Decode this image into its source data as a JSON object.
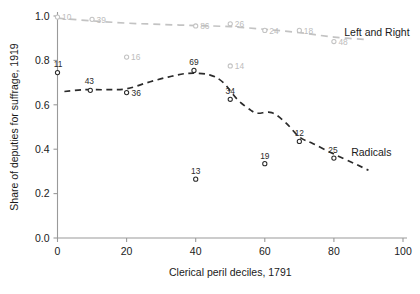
{
  "chart_data": {
    "type": "scatter",
    "title": "",
    "xlabel": "Clerical peril deciles, 1791",
    "ylabel": "Share of deputies for suffrage, 1919",
    "xlim": [
      -4,
      104
    ],
    "ylim": [
      0.0,
      1.02
    ],
    "xticks": [
      0,
      20,
      40,
      60,
      80,
      100
    ],
    "xticklabels": [
      "0",
      "20",
      "40",
      "60",
      "80",
      "100"
    ],
    "yticks": [
      0.0,
      0.2,
      0.4,
      0.6,
      0.8,
      1.0
    ],
    "yticklabels": [
      "0.0",
      "0.2",
      "0.4",
      "0.6",
      "0.8",
      "1.0"
    ],
    "grid": false,
    "legend_position": "inline-right",
    "colors": {
      "radicals": "#2b2b2b",
      "left_and_right": "#c3c3c3",
      "axis": "#9a9a9a",
      "text": "#1a1a1a"
    },
    "series": [
      {
        "name": "Left and Right",
        "label_text": "Left and Right",
        "color": "#c3c3c3",
        "marker": "open-circle",
        "linestyle": "dashed",
        "label_x": 83,
        "label_y": 0.925,
        "points": [
          {
            "x": 0,
            "y": 0.995,
            "label": "10"
          },
          {
            "x": 10,
            "y": 0.985,
            "label": "39"
          },
          {
            "x": 20,
            "y": 0.815,
            "label": "16"
          },
          {
            "x": 40,
            "y": 0.955,
            "label": "86"
          },
          {
            "x": 50,
            "y": 0.965,
            "label": "26"
          },
          {
            "x": 50,
            "y": 0.775,
            "label": "14"
          },
          {
            "x": 60,
            "y": 0.935,
            "label": "24"
          },
          {
            "x": 70,
            "y": 0.935,
            "label": "18"
          },
          {
            "x": 80,
            "y": 0.885,
            "label": "48"
          }
        ],
        "trend": [
          {
            "x": 0,
            "y": 0.99
          },
          {
            "x": 10,
            "y": 0.978
          },
          {
            "x": 20,
            "y": 0.968
          },
          {
            "x": 30,
            "y": 0.962
          },
          {
            "x": 40,
            "y": 0.957
          },
          {
            "x": 50,
            "y": 0.952
          },
          {
            "x": 60,
            "y": 0.94
          },
          {
            "x": 70,
            "y": 0.925
          },
          {
            "x": 80,
            "y": 0.905
          },
          {
            "x": 90,
            "y": 0.893
          }
        ]
      },
      {
        "name": "Radicals",
        "label_text": "Radicals",
        "color": "#2b2b2b",
        "marker": "open-circle",
        "linestyle": "dashed",
        "label_x": 85,
        "label_y": 0.385,
        "points": [
          {
            "x": 0,
            "y": 0.745,
            "label": "11"
          },
          {
            "x": 9.5,
            "y": 0.665,
            "label": "43"
          },
          {
            "x": 20,
            "y": 0.655,
            "label": "36"
          },
          {
            "x": 39.5,
            "y": 0.755,
            "label": "69"
          },
          {
            "x": 40,
            "y": 0.265,
            "label": "13"
          },
          {
            "x": 50,
            "y": 0.625,
            "label": "34"
          },
          {
            "x": 60,
            "y": 0.335,
            "label": "19"
          },
          {
            "x": 70,
            "y": 0.435,
            "label": "12"
          },
          {
            "x": 80,
            "y": 0.36,
            "label": "25"
          }
        ],
        "trend": [
          {
            "x": 2,
            "y": 0.66
          },
          {
            "x": 8,
            "y": 0.668
          },
          {
            "x": 14,
            "y": 0.668
          },
          {
            "x": 20,
            "y": 0.672
          },
          {
            "x": 26,
            "y": 0.7
          },
          {
            "x": 32,
            "y": 0.725
          },
          {
            "x": 38,
            "y": 0.742
          },
          {
            "x": 44,
            "y": 0.735
          },
          {
            "x": 48,
            "y": 0.7
          },
          {
            "x": 52,
            "y": 0.625
          },
          {
            "x": 56,
            "y": 0.575
          },
          {
            "x": 58,
            "y": 0.562
          },
          {
            "x": 62,
            "y": 0.565
          },
          {
            "x": 66,
            "y": 0.52
          },
          {
            "x": 70,
            "y": 0.455
          },
          {
            "x": 74,
            "y": 0.425
          },
          {
            "x": 80,
            "y": 0.378
          },
          {
            "x": 86,
            "y": 0.335
          },
          {
            "x": 90,
            "y": 0.305
          }
        ]
      }
    ]
  },
  "axes": {
    "x_title": "Clerical peril deciles, 1791",
    "y_title": "Share of deputies for suffrage, 1919"
  }
}
